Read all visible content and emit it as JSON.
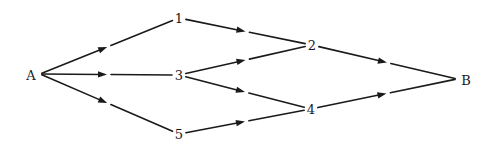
{
  "diagram": {
    "type": "directed-graph",
    "colors": {
      "stroke": "#1a1a1a",
      "background": "#ffffff"
    },
    "nodes": [
      {
        "id": "A",
        "label": "A",
        "x": 31,
        "y": 75,
        "ax": 40,
        "ay": 74
      },
      {
        "id": "1",
        "label": "1",
        "x": 179,
        "y": 18,
        "ax": 179,
        "ay": 18
      },
      {
        "id": "3",
        "label": "3",
        "x": 179,
        "y": 75,
        "ax": 179,
        "ay": 75
      },
      {
        "id": "5",
        "label": "5",
        "x": 179,
        "y": 134,
        "ax": 179,
        "ay": 134
      },
      {
        "id": "2",
        "label": "2",
        "x": 312,
        "y": 45,
        "ax": 312,
        "ay": 45
      },
      {
        "id": "4",
        "label": "4",
        "x": 311,
        "y": 109,
        "ax": 311,
        "ay": 109
      },
      {
        "id": "B",
        "label": "B",
        "x": 466,
        "y": 80,
        "ax": 457,
        "ay": 79
      }
    ],
    "edges": [
      {
        "from": "A",
        "to": "1"
      },
      {
        "from": "A",
        "to": "3"
      },
      {
        "from": "A",
        "to": "5"
      },
      {
        "from": "1",
        "to": "2"
      },
      {
        "from": "3",
        "to": "2"
      },
      {
        "from": "3",
        "to": "4"
      },
      {
        "from": "5",
        "to": "4"
      },
      {
        "from": "2",
        "to": "B"
      },
      {
        "from": "4",
        "to": "B"
      }
    ]
  }
}
